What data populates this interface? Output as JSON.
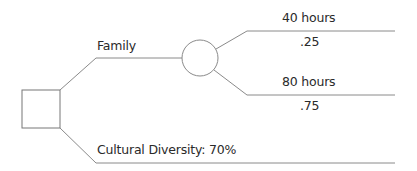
{
  "diagram": {
    "type": "decision-tree",
    "decision_node": {
      "shape": "square"
    },
    "chance_node": {
      "shape": "circle"
    },
    "branches": {
      "family": {
        "label": "Family"
      },
      "cultural": {
        "label": "Cultural Diversity: 70%"
      }
    },
    "outcomes": [
      {
        "label": "40 hours",
        "probability": ".25"
      },
      {
        "label": "80 hours",
        "probability": ".75"
      }
    ],
    "line_color": "#8a8a8a"
  }
}
